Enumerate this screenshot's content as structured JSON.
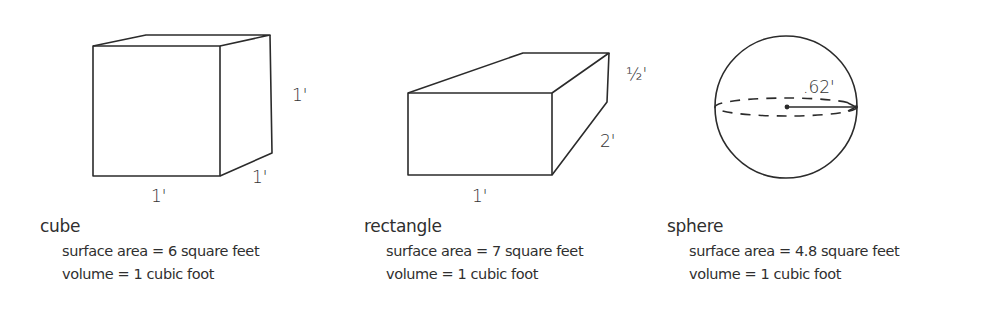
{
  "figures": [
    {
      "id": "cube",
      "name": "cube",
      "dimensions": {
        "height": "1'",
        "depth": "1'",
        "width": "1'"
      },
      "surface_area": "surface area = 6 square feet",
      "volume": "volume = 1 cubic foot"
    },
    {
      "id": "rectangle",
      "name": "rectangle",
      "dimensions": {
        "height": "½'",
        "depth": "2'",
        "width": "1'"
      },
      "surface_area": "surface area = 7 square feet",
      "volume": "volume = 1 cubic foot"
    },
    {
      "id": "sphere",
      "name": "sphere",
      "dimensions": {
        "radius": ".62'"
      },
      "surface_area": "surface area = 4.8 square feet",
      "volume": "volume = 1 cubic foot"
    }
  ],
  "colors": {
    "stroke": "#2b2b2b",
    "background": "#ffffff"
  }
}
